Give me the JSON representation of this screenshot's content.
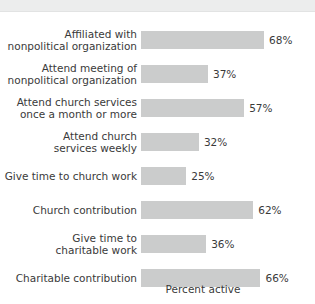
{
  "header": {
    "title": "CITIZENS",
    "note": "clipped at top edge of image"
  },
  "chart_data": {
    "type": "bar",
    "orientation": "horizontal",
    "title": "",
    "xlabel": "Percent active",
    "ylabel": "",
    "xlim": [
      0,
      100
    ],
    "grid": false,
    "legend": null,
    "bar_color": "#cbcccc",
    "text_color": "#3a3a3a",
    "value_suffix": "%",
    "categories": [
      "Affiliated with\nnonpolitical organization",
      "Attend meeting of\nnonpolitical organization",
      "Attend church services\nonce a month or more",
      "Attend church\nservices weekly",
      "Give time to church work",
      "Church contribution",
      "Give time to\ncharitable work",
      "Charitable contribution"
    ],
    "values": [
      68,
      37,
      57,
      32,
      25,
      62,
      36,
      66
    ],
    "value_labels": [
      "68%",
      "37%",
      "57%",
      "32%",
      "25%",
      "62%",
      "36%",
      "66%"
    ]
  }
}
